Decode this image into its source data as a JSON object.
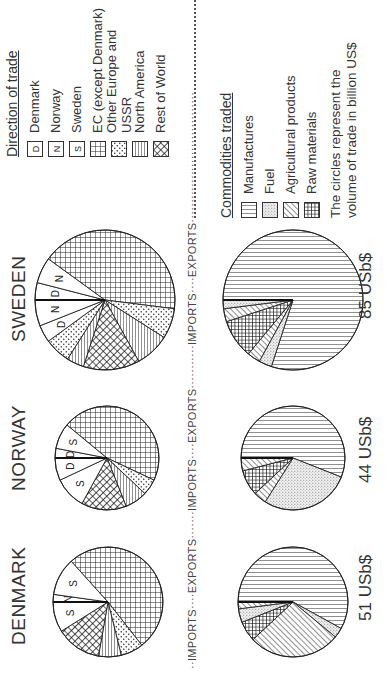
{
  "chart_data": [
    {
      "type": "pie",
      "title": "DENMARK",
      "charts": {
        "imports_by_direction": {
          "label": "IMPORTS",
          "slices": [
            {
              "name": "Norway",
              "code": "N",
              "value": 2
            },
            {
              "name": "Sweden",
              "code": "S",
              "value": 10
            },
            {
              "name": "EC (except Denmark)",
              "value": 46
            },
            {
              "name": "Other Europe and USSR",
              "value": 6
            },
            {
              "name": "North America",
              "value": 6
            },
            {
              "name": "Rest of World",
              "value": 12
            },
            {
              "name": "EC (except Denmark)",
              "value": 0
            },
            {
              "name": "Sweden",
              "code": "S",
              "value": 8
            }
          ]
        },
        "exports_by_commodity": {
          "label": "EXPORTS",
          "total_label": "51 USb$",
          "total": 51,
          "slices": [
            {
              "name": "Manufactures",
              "value": 58
            },
            {
              "name": "Fuel",
              "value": 3
            },
            {
              "name": "Agricultural products",
              "value": 27
            },
            {
              "name": "Raw materials",
              "value": 6
            },
            {
              "name": "Fuel",
              "value": 4
            },
            {
              "name": "Agricultural products",
              "value": 2
            }
          ]
        }
      }
    },
    {
      "type": "pie",
      "title": "NORWAY",
      "charts": {
        "imports_by_direction": {
          "label": "IMPORTS",
          "slices": [
            {
              "name": "Denmark",
              "code": "D",
              "value": 3
            },
            {
              "name": "Sweden",
              "code": "S",
              "value": 8
            },
            {
              "name": "EC (except Denmark)",
              "value": 46
            },
            {
              "name": "Other Europe and USSR",
              "value": 5
            },
            {
              "name": "North America",
              "value": 7
            },
            {
              "name": "Rest of World",
              "value": 14
            },
            {
              "name": "Sweden",
              "code": "S",
              "value": 10
            },
            {
              "name": "Denmark",
              "code": "D",
              "value": 7
            }
          ]
        },
        "exports_by_commodity": {
          "label": "EXPORTS",
          "total_label": "44 USb$",
          "total": 44,
          "slices": [
            {
              "name": "Manufactures",
              "value": 56
            },
            {
              "name": "Fuel",
              "value": 28
            },
            {
              "name": "Agricultural products",
              "value": 4
            },
            {
              "name": "Raw materials",
              "value": 8
            },
            {
              "name": "Agricultural products",
              "value": 4
            }
          ]
        }
      }
    },
    {
      "type": "pie",
      "title": "SWEDEN",
      "charts": {
        "imports_by_direction": {
          "label": "IMPORTS",
          "slices": [
            {
              "name": "Denmark",
              "code": "D",
              "value": 4
            },
            {
              "name": "Norway",
              "code": "N",
              "value": 6
            },
            {
              "name": "EC (except Denmark)",
              "value": 42
            },
            {
              "name": "Other Europe and USSR",
              "value": 7
            },
            {
              "name": "North America",
              "value": 8
            },
            {
              "name": "Rest of World",
              "value": 13
            },
            {
              "name": "North America",
              "value": 4
            },
            {
              "name": "Other Europe and USSR",
              "value": 6
            },
            {
              "name": "Denmark",
              "code": "D",
              "value": 4
            },
            {
              "name": "Norway",
              "code": "N",
              "value": 6
            }
          ]
        },
        "exports_by_commodity": {
          "label": "EXPORTS",
          "total_label": "85 USb$",
          "total": 85,
          "slices": [
            {
              "name": "Manufactures",
              "value": 80
            },
            {
              "name": "Fuel",
              "value": 3
            },
            {
              "name": "Agricultural products",
              "value": 3
            },
            {
              "name": "Raw materials",
              "value": 9
            },
            {
              "name": "Agricultural products",
              "value": 3
            },
            {
              "name": "Fuel",
              "value": 2
            }
          ]
        }
      }
    }
  ],
  "countries": [
    {
      "name": "DENMARK",
      "total": "51 USb$",
      "import_labels": [
        "N",
        "N",
        "S",
        "S"
      ]
    },
    {
      "name": "NORWAY",
      "total": "44 USb$",
      "import_labels": [
        "D",
        "D",
        "S",
        "S"
      ]
    },
    {
      "name": "SWEDEN",
      "total": "85 USb$",
      "import_labels": [
        "N",
        "D",
        "D",
        "N"
      ]
    }
  ],
  "separator": {
    "segments": [
      "IMPORTS",
      "EXPORTS",
      "IMPORTS",
      "EXPORTS",
      "IMPORTS",
      "EXPORTS"
    ]
  },
  "legend": {
    "direction": {
      "title": "Direction of trade",
      "items": [
        {
          "code": "D",
          "label": "Denmark",
          "pattern": "letter"
        },
        {
          "code": "N",
          "label": "Norway",
          "pattern": "letter"
        },
        {
          "code": "S",
          "label": "Sweden",
          "pattern": "letter"
        },
        {
          "label": "EC (except Denmark)",
          "pattern": "grid"
        },
        {
          "label": "Other Europe and USSR",
          "pattern": "dots"
        },
        {
          "label": "North America",
          "pattern": "hlines"
        },
        {
          "label": "Rest of World",
          "pattern": "crosshatch"
        }
      ]
    },
    "commodities": {
      "title": "Commodities traded",
      "items": [
        {
          "label": "Manufactures",
          "pattern": "vlines"
        },
        {
          "label": "Fuel",
          "pattern": "stipple"
        },
        {
          "label": "Agricultural products",
          "pattern": "diag"
        },
        {
          "label": "Raw materials",
          "pattern": "densegrid"
        }
      ]
    },
    "note": {
      "line1": "The circles represent the",
      "line2": "volume of trade in billion US$"
    }
  }
}
